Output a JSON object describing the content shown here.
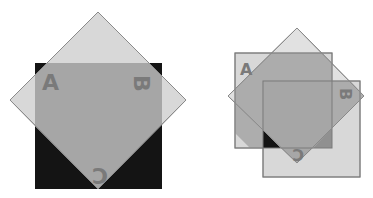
{
  "colors": {
    "background": "#ffffff",
    "light_gray": "#d8d8d8",
    "overlap_gray": "#a6a6a6",
    "black": "#141414",
    "outline": "#8a8a8a",
    "label": "#7a7a7a"
  },
  "figures": [
    {
      "name": "left-figure",
      "labels": {
        "a": "A",
        "b": "B",
        "c": "C"
      }
    },
    {
      "name": "right-figure",
      "labels": {
        "a": "A",
        "b": "B",
        "c": "C"
      }
    }
  ]
}
